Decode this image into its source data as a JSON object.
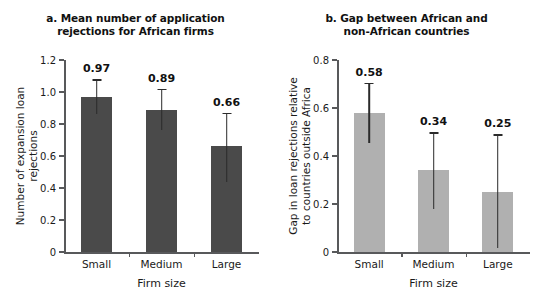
{
  "chart_data": [
    {
      "id": "a",
      "type": "bar",
      "title": "a. Mean number of application rejections for African firms",
      "title_lines": [
        "a. Mean number of application",
        "rejections for African firms"
      ],
      "xlabel": "Firm size",
      "ylabel": "Number of expansion loan rejections",
      "ylabel_lines": [
        "Number of expansion loan",
        "rejections"
      ],
      "categories": [
        "Small",
        "Medium",
        "Large"
      ],
      "values": [
        0.97,
        0.89,
        0.66
      ],
      "value_labels": [
        "0.97",
        "0.89",
        "0.66"
      ],
      "error_low": [
        0.86,
        0.76,
        0.44
      ],
      "error_high": [
        1.08,
        1.02,
        0.87
      ],
      "ylim": [
        0,
        1.2
      ],
      "yticks": [
        0,
        0.2,
        0.4,
        0.6,
        0.8,
        1.0,
        1.2
      ],
      "ytick_labels": [
        "0",
        "0.2",
        "0.4",
        "0.6",
        "0.8",
        "1.0",
        "1.2"
      ],
      "bar_color": "#4a4a4a",
      "error_color": "#2b2b2b",
      "grid": false,
      "legend": "none"
    },
    {
      "id": "b",
      "type": "bar",
      "title": "b. Gap between African and non-African countries",
      "title_lines": [
        "b. Gap between African and",
        "non-African countries"
      ],
      "xlabel": "Firm size",
      "ylabel": "Gap in loan rejections relative to countries outside Africa",
      "ylabel_lines": [
        "Gap in loan rejections relative",
        "to countries outside Africa"
      ],
      "categories": [
        "Small",
        "Medium",
        "Large"
      ],
      "values": [
        0.58,
        0.34,
        0.25
      ],
      "value_labels": [
        "0.58",
        "0.34",
        "0.25"
      ],
      "error_low": [
        0.455,
        0.18,
        0.015
      ],
      "error_high": [
        0.705,
        0.5,
        0.49
      ],
      "ylim": [
        0,
        0.8
      ],
      "yticks": [
        0,
        0.2,
        0.4,
        0.6,
        0.8
      ],
      "ytick_labels": [
        "0",
        "0.2",
        "0.4",
        "0.6",
        "0.8"
      ],
      "bar_color": "#b0b0b0",
      "error_color": "#2b2b2b",
      "grid": false,
      "legend": "none"
    }
  ]
}
